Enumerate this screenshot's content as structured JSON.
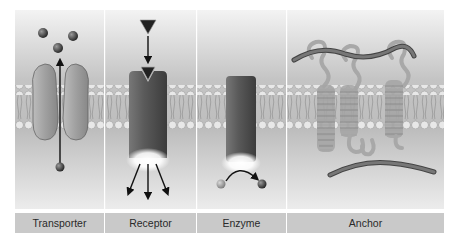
{
  "figure": {
    "type": "membrane-protein-functions",
    "panels": [
      {
        "id": "transporter",
        "label": "Transporter"
      },
      {
        "id": "receptor",
        "label": "Receptor"
      },
      {
        "id": "enzyme",
        "label": "Enzyme"
      },
      {
        "id": "anchor",
        "label": "Anchor"
      }
    ]
  },
  "colors": {
    "background_top": "#f2f2f2",
    "background_mid": "#bdbdbd",
    "label_band": "#c9c9c9",
    "protein_light": "#9a9a9a",
    "protein_dark": "#444444",
    "lipid_head": "#e6e6e6",
    "molecule": "#333333"
  }
}
